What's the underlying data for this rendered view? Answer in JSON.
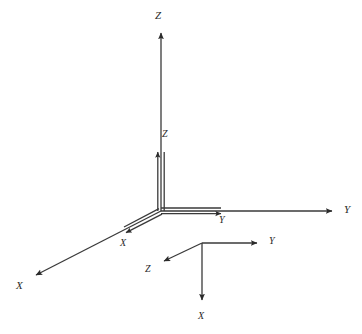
{
  "figure": {
    "width": 362,
    "height": 334,
    "background_color": "#ffffff",
    "line_color": "#333333",
    "label_color": "#2a2a2a"
  },
  "systems": [
    {
      "name": "outer-coordinate-system",
      "origin": {
        "x": 161,
        "y": 211
      },
      "axes": [
        {
          "id": "outer-z",
          "label": "Z",
          "direction": "up",
          "tip": {
            "x": 161,
            "y": 28
          },
          "label_pos": {
            "x": 155,
            "y": 10
          }
        },
        {
          "id": "outer-y",
          "label": "Y",
          "direction": "right",
          "tip": {
            "x": 337,
            "y": 211
          },
          "label_pos": {
            "x": 344,
            "y": 204
          }
        },
        {
          "id": "outer-x",
          "label": "X",
          "direction": "down-left",
          "tip": {
            "x": 30,
            "y": 279
          },
          "label_pos": {
            "x": 16,
            "y": 280
          }
        }
      ]
    },
    {
      "name": "inner-coordinate-system",
      "origin": {
        "x": 161,
        "y": 211
      },
      "axes": [
        {
          "id": "inner-z",
          "label": "Z",
          "direction": "up",
          "tip": {
            "x": 161,
            "y": 147
          },
          "label_pos": {
            "x": 162,
            "y": 129
          }
        },
        {
          "id": "inner-y",
          "label": "Y",
          "direction": "right",
          "tip": {
            "x": 227,
            "y": 211
          },
          "label_pos": {
            "x": 219,
            "y": 215
          }
        },
        {
          "id": "inner-x",
          "label": "X",
          "direction": "down-left",
          "tip": {
            "x": 119,
            "y": 234
          },
          "label_pos": {
            "x": 120,
            "y": 238
          }
        }
      ]
    },
    {
      "name": "lower-coordinate-system",
      "origin": {
        "x": 202,
        "y": 243
      },
      "axes": [
        {
          "id": "lower-y",
          "label": "Y",
          "direction": "right",
          "tip": {
            "x": 263,
            "y": 243
          },
          "label_pos": {
            "x": 269,
            "y": 236
          }
        },
        {
          "id": "lower-z",
          "label": "Z",
          "direction": "down-left",
          "tip": {
            "x": 158,
            "y": 264
          },
          "label_pos": {
            "x": 145,
            "y": 264
          }
        },
        {
          "id": "lower-x",
          "label": "X",
          "direction": "down",
          "tip": {
            "x": 202,
            "y": 306
          },
          "label_pos": {
            "x": 198,
            "y": 311
          }
        }
      ]
    }
  ]
}
